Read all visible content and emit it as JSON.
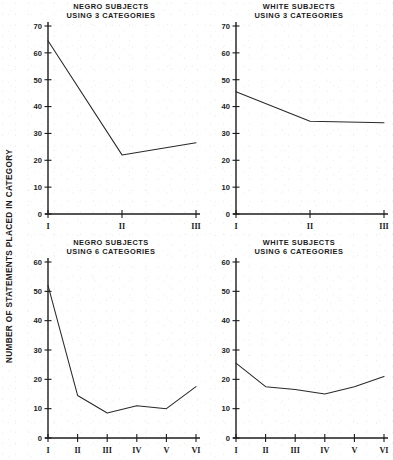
{
  "figure": {
    "background_color": "#ffffff",
    "ink_color": "#1c1c1c",
    "shared_ylabel": "NUMBER OF STATEMENTS PLACED IN CATEGORY"
  },
  "chart_data": [
    {
      "type": "line",
      "panel": "top-left",
      "title": "NEGRO SUBJECTS",
      "subtitle": "USING 3 CATEGORIES",
      "categories": [
        "I",
        "II",
        "III"
      ],
      "values": [
        64.5,
        22.0,
        26.5
      ],
      "xlabel": "",
      "ylabel": "NUMBER OF STATEMENTS PLACED IN CATEGORY",
      "ylim": [
        0,
        70
      ],
      "yticks": [
        0,
        10,
        20,
        30,
        40,
        50,
        60,
        70
      ],
      "grid": false,
      "legend": "none"
    },
    {
      "type": "line",
      "panel": "top-right",
      "title": "WHITE SUBJECTS",
      "subtitle": "USING 3 CATEGORIES",
      "categories": [
        "I",
        "II",
        "III"
      ],
      "values": [
        45.5,
        34.5,
        34.0
      ],
      "xlabel": "",
      "ylabel": "",
      "ylim": [
        0,
        70
      ],
      "yticks": [
        0,
        10,
        20,
        30,
        40,
        50,
        60,
        70
      ],
      "grid": false,
      "legend": "none"
    },
    {
      "type": "line",
      "panel": "bottom-left",
      "title": "NEGRO SUBJECTS",
      "subtitle": "USING 6 CATEGORIES",
      "categories": [
        "I",
        "II",
        "III",
        "IV",
        "V",
        "VI"
      ],
      "values": [
        52.0,
        14.5,
        8.5,
        11.0,
        10.0,
        17.5
      ],
      "xlabel": "",
      "ylabel": "NUMBER OF STATEMENTS PLACED IN CATEGORY",
      "ylim": [
        0,
        60
      ],
      "yticks": [
        0,
        10,
        20,
        30,
        40,
        50,
        60
      ],
      "grid": false,
      "legend": "none"
    },
    {
      "type": "line",
      "panel": "bottom-right",
      "title": "WHITE SUBJECTS",
      "subtitle": "USING 6 CATEGORIES",
      "categories": [
        "I",
        "II",
        "III",
        "IV",
        "V",
        "VI"
      ],
      "values": [
        25.5,
        17.5,
        16.5,
        15.0,
        17.5,
        21.0
      ],
      "xlabel": "",
      "ylabel": "",
      "ylim": [
        0,
        60
      ],
      "yticks": [
        0,
        10,
        20,
        30,
        40,
        50,
        60
      ],
      "grid": false,
      "legend": "none"
    }
  ]
}
